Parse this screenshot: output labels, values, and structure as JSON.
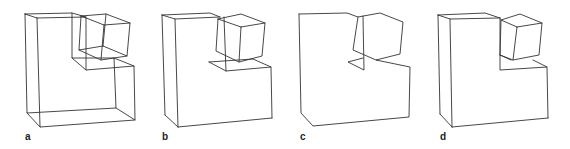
{
  "figure": {
    "line_color": "#333333",
    "background": "#ffffff",
    "panels": [
      {
        "label": "a",
        "style": "wireframe with all hidden edges"
      },
      {
        "label": "b",
        "style": "hidden lines removed, with some overlap artefacts"
      },
      {
        "label": "c",
        "style": "silhouette outline only"
      },
      {
        "label": "d",
        "style": "hidden lines removed, clean"
      }
    ]
  }
}
